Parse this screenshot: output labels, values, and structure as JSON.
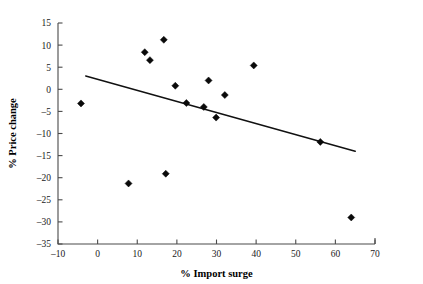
{
  "chart_data": {
    "type": "scatter",
    "title": "",
    "xlabel": "% Import surge",
    "ylabel": "% Price change",
    "xlim": [
      -10,
      70
    ],
    "ylim": [
      -35,
      15
    ],
    "xticks": [
      -10,
      0,
      10,
      20,
      30,
      40,
      50,
      60,
      70
    ],
    "xtick_labels": [
      "–10",
      "0",
      "10",
      "20",
      "30",
      "40",
      "50",
      "60",
      "70"
    ],
    "yticks": [
      15,
      10,
      5,
      0,
      -5,
      -10,
      -15,
      -20,
      -25,
      -30,
      -35
    ],
    "ytick_labels": [
      "15",
      "10",
      "5",
      "0",
      "–5",
      "–10",
      "–15",
      "–20",
      "–25",
      "–30",
      "–35"
    ],
    "grid": false,
    "legend": null,
    "marker_style": "diamond",
    "marker_color": "#0a0a0a",
    "points": [
      {
        "x": -4.2,
        "y": -3.2
      },
      {
        "x": 7.8,
        "y": -21.3
      },
      {
        "x": 11.9,
        "y": 8.4
      },
      {
        "x": 13.2,
        "y": 6.6
      },
      {
        "x": 16.7,
        "y": 11.2
      },
      {
        "x": 17.2,
        "y": -19.1
      },
      {
        "x": 19.6,
        "y": 0.8
      },
      {
        "x": 22.4,
        "y": -3.1
      },
      {
        "x": 26.8,
        "y": -4.0
      },
      {
        "x": 28.0,
        "y": 2.0
      },
      {
        "x": 29.9,
        "y": -6.4
      },
      {
        "x": 32.1,
        "y": -1.3
      },
      {
        "x": 39.4,
        "y": 5.4
      },
      {
        "x": 56.2,
        "y": -11.9
      },
      {
        "x": 64.0,
        "y": -29.0
      }
    ],
    "trendline": {
      "x_start": -3.0,
      "y_start": 3.0,
      "x_end": 65.0,
      "y_end": -14.0,
      "color": "#111111"
    }
  }
}
